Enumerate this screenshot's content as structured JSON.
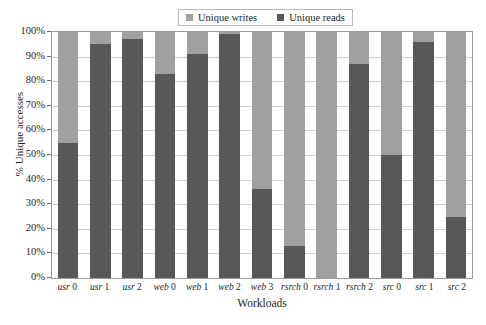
{
  "chart_data": {
    "type": "bar",
    "subtype": "stacked-100-percent",
    "title": "",
    "xlabel": "Workloads",
    "ylabel": "% Unique accesses",
    "categories": [
      "usr 0",
      "usr 1",
      "usr 2",
      "web 0",
      "web 1",
      "web 2",
      "web 3",
      "rsrch 0",
      "rsrch 1",
      "rsrch 2",
      "src 0",
      "src 1",
      "src 2"
    ],
    "series": [
      {
        "name": "Unique reads",
        "color": "#585858",
        "values": [
          55,
          95,
          97,
          83,
          91,
          99,
          36,
          13,
          0,
          87,
          50,
          96,
          25
        ]
      },
      {
        "name": "Unique writes",
        "color": "#a0a0a0",
        "values": [
          45,
          5,
          3,
          17,
          9,
          1,
          64,
          87,
          100,
          13,
          50,
          4,
          75
        ]
      }
    ],
    "ylim": [
      0,
      100
    ],
    "yticks": [
      "0%",
      "10%",
      "20%",
      "30%",
      "40%",
      "50%",
      "60%",
      "70%",
      "80%",
      "90%",
      "100%"
    ],
    "ytick_values": [
      0,
      10,
      20,
      30,
      40,
      50,
      60,
      70,
      80,
      90,
      100
    ],
    "grid": true,
    "legend_position": "top-center"
  },
  "legend": {
    "entries": [
      {
        "label": "Unique writes",
        "color": "#a0a0a0"
      },
      {
        "label": "Unique reads",
        "color": "#585858"
      }
    ]
  },
  "axes": {
    "y_title": "% Unique accesses",
    "x_title": "Workloads"
  }
}
